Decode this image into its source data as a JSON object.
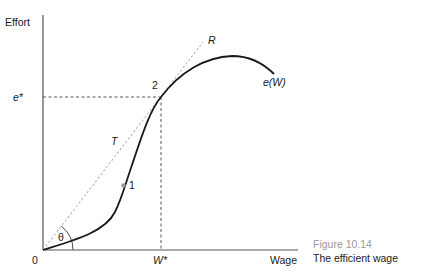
{
  "figure": {
    "number": "Figure 10.14",
    "title": "The efficient wage"
  },
  "axes": {
    "y_label": "Effort",
    "x_label": "Wage",
    "origin_label": "0"
  },
  "markers": {
    "e_star": "e*",
    "w_star": "W*"
  },
  "curve": {
    "label": "e(W)"
  },
  "ray": {
    "start_label": "T",
    "end_label": "R",
    "angle_label": "θ"
  },
  "points": [
    {
      "label": "1",
      "description": "inflection point"
    },
    {
      "label": "2",
      "description": "tangency point"
    }
  ],
  "colors": {
    "curve": "#1a1a1a",
    "axis": "#555555",
    "ray": "#bbbbbb",
    "dashed": "#444444",
    "point1": "#999999",
    "caption_number": "#9a9a9a"
  }
}
